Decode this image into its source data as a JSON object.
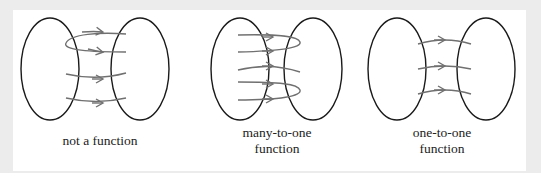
{
  "colors": {
    "background": "#ececec",
    "panel": "#ffffff",
    "ellipse": "#1a1a1a",
    "arrow": "#707070"
  },
  "diagrams": [
    {
      "id": "not-a-function",
      "label_lines": [
        "not a function"
      ]
    },
    {
      "id": "many-to-one",
      "label_lines": [
        "many-to-one",
        "function"
      ]
    },
    {
      "id": "one-to-one",
      "label_lines": [
        "one-to-one",
        "function"
      ]
    }
  ]
}
